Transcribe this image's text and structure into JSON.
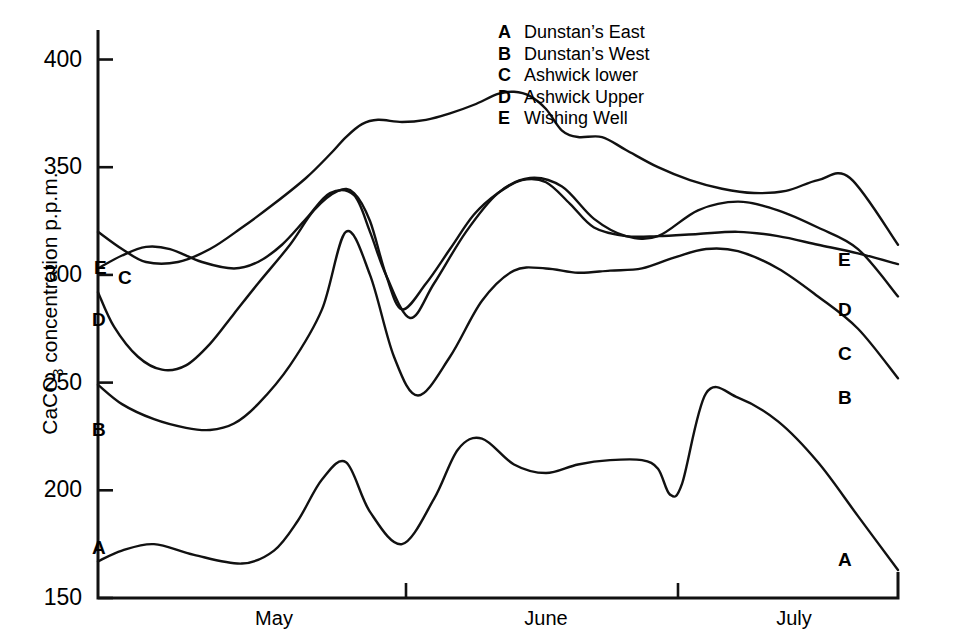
{
  "axes": {
    "y_label_prefix": "CaCO",
    "y_label_sub": "3",
    "y_label_suffix": " concentration p.p.m.",
    "y_ticks": [
      "400",
      "350",
      "300",
      "250",
      "200",
      "150"
    ],
    "x_ticks": [
      "May",
      "June",
      "July"
    ]
  },
  "legend": {
    "items": [
      {
        "key": "A",
        "label": "Dunstan’s East"
      },
      {
        "key": "B",
        "label": "Dunstan’s West"
      },
      {
        "key": "C",
        "label": "Ashwick lower"
      },
      {
        "key": "D",
        "label": "Ashwick Upper"
      },
      {
        "key": "E",
        "label": "Wishing Well"
      }
    ]
  },
  "left_labels": [
    {
      "key": "E"
    },
    {
      "key": "C"
    },
    {
      "key": "D"
    },
    {
      "key": "B"
    },
    {
      "key": "A"
    }
  ],
  "right_labels": [
    {
      "key": "E"
    },
    {
      "key": "D"
    },
    {
      "key": "C"
    },
    {
      "key": "B"
    },
    {
      "key": "A"
    }
  ],
  "chart_data": {
    "type": "line",
    "title": "",
    "xlabel": "",
    "ylabel": "CaCO3 concentration p.p.m.",
    "ylim": [
      150,
      425
    ],
    "xlim": [
      0,
      100
    ],
    "grid": false,
    "legend_position": "top-right",
    "x_tick_labels": [
      "May",
      "June",
      "July"
    ],
    "x_tick_positions": [
      22,
      56,
      87
    ],
    "y_tick_values": [
      150,
      200,
      250,
      300,
      350,
      400
    ],
    "series": [
      {
        "name": "Dunstan’s East",
        "key": "A",
        "x": [
          0,
          3,
          7,
          12,
          18,
          22,
          25,
          28,
          31,
          34,
          38,
          42,
          45,
          48,
          52,
          56,
          60,
          64,
          68,
          70,
          71.5,
          73,
          76,
          80,
          85,
          90,
          95,
          100
        ],
        "y": [
          167,
          172,
          175,
          170,
          166,
          172,
          186,
          205,
          213,
          190,
          175,
          196,
          219,
          224,
          212,
          208,
          212,
          214,
          214,
          210,
          198,
          203,
          245,
          243,
          232,
          213,
          188,
          163
        ]
      },
      {
        "name": "Dunstan’s West",
        "key": "B",
        "x": [
          0,
          3,
          7,
          11,
          14,
          17,
          20,
          24,
          28,
          31,
          34,
          37,
          40,
          44,
          48,
          52,
          56,
          60,
          64,
          68,
          72,
          76,
          80,
          85,
          90,
          95,
          100
        ],
        "y": [
          249,
          240,
          233,
          229,
          228,
          231,
          240,
          258,
          284,
          320,
          300,
          262,
          244,
          262,
          288,
          302,
          303,
          301,
          302,
          303,
          308,
          312,
          311,
          303,
          290,
          275,
          252
        ]
      },
      {
        "name": "Ashwick lower",
        "key": "C",
        "x": [
          0,
          3,
          6,
          9,
          13,
          17,
          20,
          23,
          26,
          29,
          32,
          34,
          36,
          39,
          42,
          46,
          50,
          54,
          58,
          62,
          66,
          70,
          75,
          80,
          85,
          90,
          95,
          100
        ],
        "y": [
          303,
          309,
          313,
          312,
          306,
          303,
          306,
          314,
          326,
          338,
          337,
          320,
          300,
          280,
          296,
          320,
          338,
          345,
          341,
          326,
          318,
          318,
          330,
          334,
          330,
          322,
          312,
          290
        ]
      },
      {
        "name": "Ashwick Upper",
        "key": "D",
        "x": [
          0,
          2,
          5,
          8,
          11,
          14,
          17,
          20,
          24,
          27,
          30,
          32,
          34,
          36,
          38,
          41,
          44,
          47,
          50,
          53,
          56,
          59,
          62,
          66,
          70,
          75,
          80,
          85,
          90,
          95,
          100
        ],
        "y": [
          292,
          276,
          262,
          256,
          258,
          268,
          282,
          296,
          314,
          330,
          339,
          338,
          325,
          300,
          284,
          296,
          312,
          328,
          338,
          344,
          343,
          333,
          322,
          318,
          318,
          319,
          320,
          318,
          314,
          310,
          305
        ]
      },
      {
        "name": "Wishing Well",
        "key": "E",
        "x": [
          0,
          3,
          6,
          10,
          14,
          18,
          22,
          26,
          29,
          31,
          33,
          35,
          38,
          41,
          44,
          47,
          50,
          52,
          54,
          56,
          58,
          60,
          63,
          66,
          70,
          74,
          78,
          82,
          86,
          90,
          94,
          100
        ],
        "y": [
          320,
          312,
          306,
          306,
          312,
          322,
          333,
          345,
          356,
          364,
          370,
          372,
          371,
          372,
          375,
          379,
          384,
          385,
          383,
          377,
          367,
          364,
          364,
          358,
          350,
          344,
          340,
          338,
          339,
          344,
          345,
          314
        ]
      }
    ]
  }
}
